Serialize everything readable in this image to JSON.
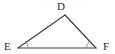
{
  "figure": {
    "kind": "geometry-diagram",
    "shape": "triangle",
    "name": "Triangle DEF",
    "background_color": "#ffffff",
    "stroke_color": "#3a3a3a",
    "label_color": "#2b2b2b",
    "arc_color": "#8a8a8a",
    "labels": {
      "apex": "D",
      "bottom_left": "E",
      "bottom_right": "F"
    },
    "vertices": [
      {
        "id": "D",
        "label": "D",
        "x": 65,
        "y": 15
      },
      {
        "id": "E",
        "label": "E",
        "x": 18,
        "y": 48
      },
      {
        "id": "F",
        "label": "F",
        "x": 96,
        "y": 48
      }
    ],
    "sides": [
      {
        "id": "DE",
        "from": "E",
        "to": "D"
      },
      {
        "id": "DF",
        "from": "D",
        "to": "F"
      },
      {
        "id": "EF",
        "from": "E",
        "to": "F"
      }
    ],
    "angle_marks": [
      {
        "at": "E",
        "label": "angle-arc-E",
        "ticks": 1
      },
      {
        "at": "F",
        "label": "angle-arc-F",
        "ticks": 1
      }
    ]
  }
}
